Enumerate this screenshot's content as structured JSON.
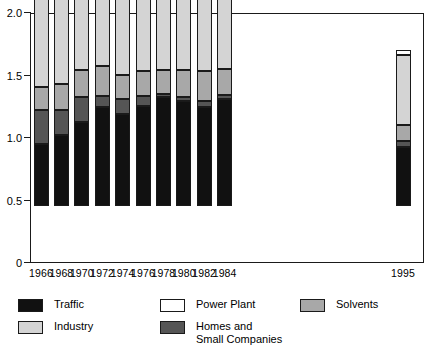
{
  "chart_data": {
    "type": "bar",
    "subtype": "stacked-bar",
    "title": "",
    "xlabel": "",
    "ylabel": "",
    "ylim": [
      0,
      2.0
    ],
    "yticks": [
      0,
      0.5,
      1.0,
      1.5,
      2.0
    ],
    "ytick_labels": [
      "0",
      "0.5",
      "1.0",
      "1.5",
      "2.0"
    ],
    "grid": false,
    "legend_position": "bottom",
    "categories": [
      "1966",
      "1968",
      "1970",
      "1972",
      "1974",
      "1976",
      "1978",
      "1980",
      "1982",
      "1984",
      "1995"
    ],
    "series": [
      {
        "name": "Traffic",
        "color": "#111111",
        "values": [
          0.5,
          0.57,
          0.67,
          0.79,
          0.74,
          0.8,
          0.87,
          0.84,
          0.79,
          0.86,
          0.47
        ]
      },
      {
        "name": "Homes and\nSmall Companies",
        "color": "#555555",
        "values": [
          0.27,
          0.2,
          0.2,
          0.09,
          0.12,
          0.08,
          0.03,
          0.03,
          0.05,
          0.03,
          0.05
        ]
      },
      {
        "name": "Solvents",
        "color": "#a8a8a8",
        "values": [
          0.18,
          0.21,
          0.22,
          0.24,
          0.19,
          0.2,
          0.19,
          0.22,
          0.24,
          0.21,
          0.13
        ]
      },
      {
        "name": "Industry",
        "color": "#d4d4d4",
        "values": [
          0.71,
          0.73,
          0.76,
          0.78,
          0.82,
          0.8,
          0.79,
          0.8,
          0.8,
          0.76,
          0.56
        ]
      },
      {
        "name": "Power Plant",
        "color": "#ffffff",
        "values": [
          0.04,
          0.04,
          0.04,
          0.03,
          0.04,
          0.04,
          0.04,
          0.03,
          0.04,
          0.04,
          0.04
        ]
      }
    ],
    "totals": [
      1.7,
      1.75,
      1.89,
      1.93,
      1.91,
      1.92,
      1.92,
      1.92,
      1.92,
      1.9,
      1.25
    ]
  },
  "axis": {
    "y_tick_labels": [
      "2.0",
      "1.5",
      "1.0",
      "0.5",
      "0"
    ],
    "x_tick_labels": [
      "1966",
      "1968",
      "1970",
      "1972",
      "1974",
      "1976",
      "1978",
      "1980",
      "1982",
      "1984",
      "1995"
    ]
  },
  "legend": {
    "items": [
      {
        "label": "Traffic",
        "color": "#111111"
      },
      {
        "label": "Power Plant",
        "color": "#ffffff"
      },
      {
        "label": "Solvents",
        "color": "#a8a8a8"
      },
      {
        "label": "Industry",
        "color": "#d4d4d4"
      },
      {
        "label": "Homes and\nSmall Companies",
        "color": "#555555"
      }
    ]
  }
}
